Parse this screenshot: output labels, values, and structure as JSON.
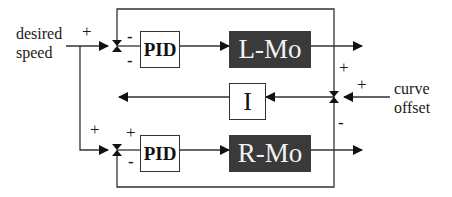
{
  "diagram": {
    "inputs": {
      "desired_speed_line1": "desired",
      "desired_speed_line2": "speed",
      "curve_offset_line1": "curve",
      "curve_offset_line2": "offset"
    },
    "blocks": {
      "pid_top": "PID",
      "pid_bottom": "PID",
      "left_motor": "L-Mo",
      "right_motor": "R-Mo",
      "integrator": "I"
    },
    "signs": {
      "desired_speed": "+",
      "top_junction_upper": "-",
      "top_junction_lower": "-",
      "bottom_branch": "+",
      "bottom_junction_upper": "+",
      "bottom_junction_lower": "-",
      "right_junction_upper": "+",
      "curve_offset": "+",
      "right_junction_lower": "-"
    },
    "colors": {
      "line": "#333333",
      "motor_fill": "#3a3a3a",
      "motor_text": "#f2f2f2"
    }
  }
}
